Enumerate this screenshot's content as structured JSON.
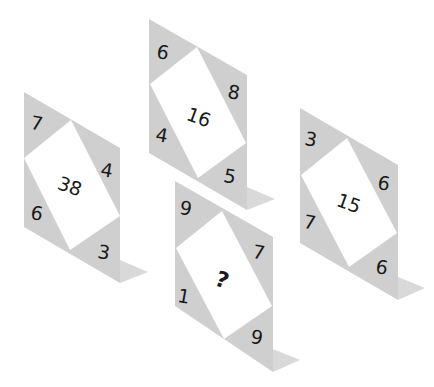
{
  "puzzle": {
    "panels": [
      {
        "id": "A",
        "corners": {
          "top_left": "7",
          "top_right": "4",
          "bottom_left": "6",
          "bottom_right": "3"
        },
        "center": "38"
      },
      {
        "id": "B",
        "corners": {
          "top_left": "6",
          "top_right": "8",
          "bottom_left": "4",
          "bottom_right": "5"
        },
        "center": "16"
      },
      {
        "id": "C",
        "corners": {
          "top_left": "3",
          "top_right": "6",
          "bottom_left": "7",
          "bottom_right": "6"
        },
        "center": "15"
      },
      {
        "id": "D",
        "corners": {
          "top_left": "9",
          "top_right": "7",
          "bottom_left": "1",
          "bottom_right": "9"
        },
        "center": "?"
      }
    ]
  },
  "colors": {
    "panel_grey": "#cfcfcf",
    "inner_white": "#ffffff",
    "foot": "#d9d9d9",
    "text": "#1a1a1a"
  }
}
